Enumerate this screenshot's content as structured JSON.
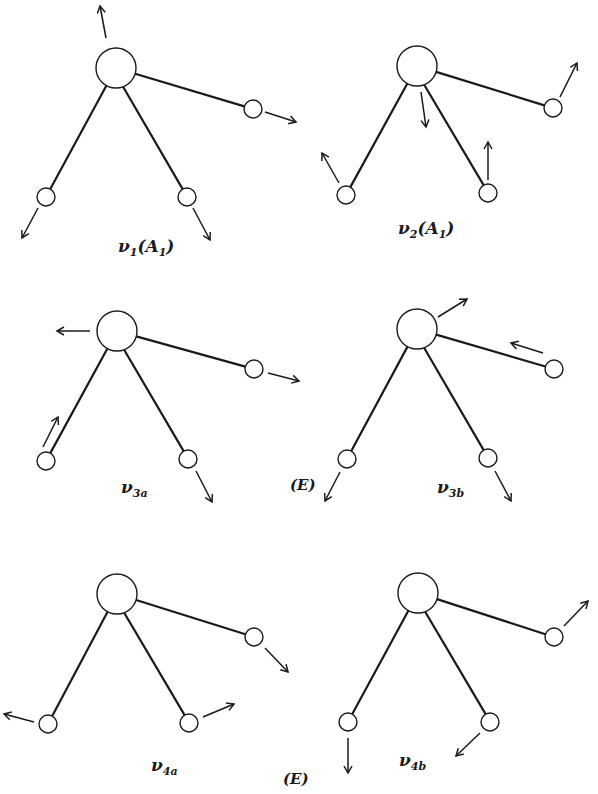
{
  "figure": {
    "panels": [
      {
        "id": "v1",
        "label_main": "ν",
        "label_sub": "1",
        "label_suffix": "(A",
        "label_sub2": "1",
        "label_close": ")",
        "symmetry": "A1",
        "center": [
          116,
          68
        ],
        "atoms": [
          [
            253,
            109
          ],
          [
            46,
            197
          ],
          [
            187,
            197
          ]
        ],
        "arrows": [
          [
            106,
            38,
            100,
            6
          ],
          [
            265,
            112,
            296,
            122
          ],
          [
            38,
            208,
            22,
            238
          ],
          [
            193,
            208,
            210,
            240
          ]
        ]
      },
      {
        "id": "v2",
        "label_main": "ν",
        "label_sub": "2",
        "label_suffix": "(A",
        "label_sub2": "1",
        "label_close": ")",
        "symmetry": "A1",
        "center": [
          417,
          66
        ],
        "atoms": [
          [
            553,
            108
          ],
          [
            346,
            195
          ],
          [
            488,
            193
          ]
        ],
        "arrows": [
          [
            421,
            92,
            426,
            127
          ],
          [
            560,
            97,
            577,
            63
          ],
          [
            339,
            183,
            322,
            153
          ],
          [
            488,
            180,
            488,
            142
          ]
        ]
      },
      {
        "id": "v3a",
        "label_main": "ν",
        "label_sub": "3a",
        "symmetry": "E",
        "center": [
          117,
          331
        ],
        "atoms": [
          [
            254,
            369
          ],
          [
            46,
            461
          ],
          [
            188,
            459
          ]
        ],
        "arrows": [
          [
            90,
            331,
            57,
            331
          ],
          [
            268,
            373,
            299,
            381
          ],
          [
            43,
            447,
            58,
            417
          ],
          [
            196,
            471,
            212,
            502
          ]
        ]
      },
      {
        "id": "v3b",
        "label_main": "ν",
        "label_sub": "3b",
        "symmetry": "E",
        "center": [
          417,
          329
        ],
        "atoms": [
          [
            554,
            369
          ],
          [
            347,
            459
          ],
          [
            488,
            458
          ]
        ],
        "arrows": [
          [
            438,
            317,
            467,
            299
          ],
          [
            543,
            353,
            511,
            343
          ],
          [
            340,
            472,
            325,
            501
          ],
          [
            495,
            471,
            511,
            501
          ]
        ]
      },
      {
        "id": "v4a",
        "label_main": "ν",
        "label_sub": "4a",
        "symmetry": "E",
        "center": [
          117,
          594
        ],
        "atoms": [
          [
            254,
            637
          ],
          [
            48,
            724
          ],
          [
            189,
            723
          ]
        ],
        "arrows": [
          [
            265,
            648,
            288,
            672
          ],
          [
            34,
            722,
            4,
            714
          ],
          [
            203,
            717,
            234,
            704
          ]
        ]
      },
      {
        "id": "v4b",
        "label_main": "ν",
        "label_sub": "4b",
        "symmetry": "E",
        "center": [
          418,
          593
        ],
        "atoms": [
          [
            554,
            637
          ],
          [
            348,
            722
          ],
          [
            490,
            722
          ]
        ],
        "arrows": [
          [
            564,
            626,
            588,
            601
          ],
          [
            348,
            738,
            348,
            773
          ],
          [
            480,
            733,
            456,
            756
          ]
        ]
      }
    ],
    "group_labels": [
      {
        "text": "(E)",
        "x": 290,
        "y": 492
      },
      {
        "text": "(E)",
        "x": 284,
        "y": 784
      }
    ],
    "labels": {
      "v1": {
        "text": "ν",
        "sub": "1",
        "rest": "(A",
        "sub2": "1",
        "close": ")"
      },
      "v2": {
        "text": "ν",
        "sub": "2",
        "rest": "(A",
        "sub2": "1",
        "close": ")"
      },
      "v3a": {
        "text": "ν",
        "sub": "3a"
      },
      "v3b": {
        "text": "ν",
        "sub": "3b"
      },
      "v4a": {
        "text": "ν",
        "sub": "4a"
      },
      "v4b": {
        "text": "ν",
        "sub": "4b"
      },
      "e1": "(E)",
      "e2": "(E)"
    }
  }
}
